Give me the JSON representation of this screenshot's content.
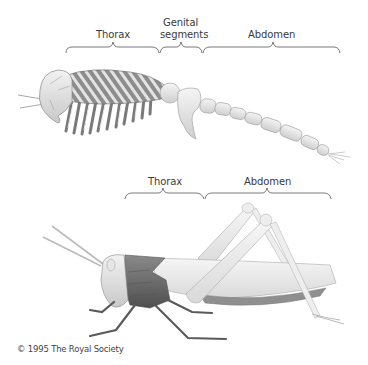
{
  "figure": {
    "top_diagram": {
      "subject": "segmented-ancestral-arthropod",
      "labels": [
        {
          "id": "thorax",
          "text": "Thorax"
        },
        {
          "id": "genital_line1",
          "text": "Genital"
        },
        {
          "id": "genital_line2",
          "text": "segments"
        },
        {
          "id": "abdomen",
          "text": "Abdomen"
        }
      ]
    },
    "bottom_diagram": {
      "subject": "grasshopper",
      "labels": [
        {
          "id": "thorax",
          "text": "Thorax"
        },
        {
          "id": "abdomen",
          "text": "Abdomen"
        }
      ]
    },
    "copyright": "© 1995 The Royal Society",
    "colors": {
      "label_text": "#3a3a3a",
      "bracket": "#555555",
      "thorax_dark": "#6b6b6b",
      "body_light": "#e6e6e6"
    }
  }
}
